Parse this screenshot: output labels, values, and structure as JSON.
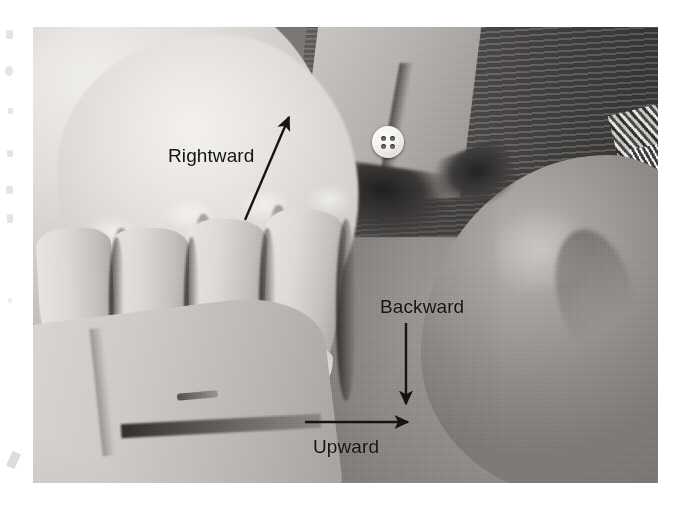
{
  "figure": {
    "kind": "scanned-clinical-photograph",
    "frame": {
      "left": 33,
      "top": 27,
      "width": 625,
      "height": 456
    },
    "page_background": "#ffffff",
    "photo_tone": "grayscale"
  },
  "annotations": {
    "color": "#141414",
    "items": [
      {
        "id": "rightward",
        "label": "Rightward",
        "arrow_direction": "up-right",
        "arrow_from": [
          245,
          220
        ],
        "arrow_to": [
          291,
          113
        ],
        "label_position": [
          168,
          146
        ]
      },
      {
        "id": "backward",
        "label": "Backward",
        "arrow_direction": "down",
        "arrow_from": [
          406,
          323
        ],
        "arrow_to": [
          406,
          409
        ],
        "label_position": [
          380,
          297
        ]
      },
      {
        "id": "upward",
        "label": "Upward",
        "arrow_direction": "right",
        "arrow_from": [
          305,
          422
        ],
        "arrow_to": [
          413,
          422
        ],
        "label_position": [
          313,
          437
        ]
      }
    ]
  },
  "photo_elements": {
    "shirt_button": {
      "name": "shirt-button",
      "holes": 4,
      "color": "#f3f1ee"
    },
    "regions": [
      "examining-hand",
      "patient-shoulder",
      "dark-garment",
      "light-collar",
      "sleeve-cuff",
      "metallic-object"
    ]
  },
  "margin_artifacts": {
    "count": 8,
    "color": "#cfcfcf"
  }
}
